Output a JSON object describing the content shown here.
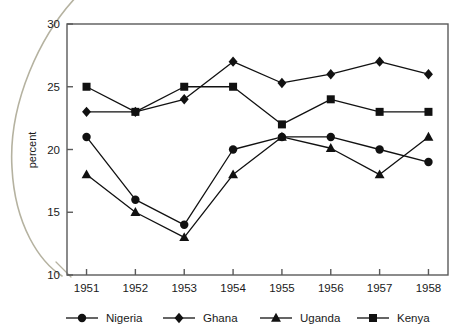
{
  "chart_data": {
    "type": "line",
    "title": "",
    "subtitle": "",
    "xlabel": "",
    "ylabel": "percent",
    "categories": [
      "1951",
      "1952",
      "1953",
      "1954",
      "1955",
      "1956",
      "1957",
      "1958"
    ],
    "x": [
      1951,
      1952,
      1953,
      1954,
      1955,
      1956,
      1957,
      1958
    ],
    "xlim": [
      1950.6,
      1958.4
    ],
    "ylim": [
      10,
      30
    ],
    "yticks": [
      10,
      15,
      20,
      25,
      30
    ],
    "ytick_labels": [
      "10",
      "15",
      "20",
      "25",
      "30"
    ],
    "xticks": [
      1951,
      1952,
      1953,
      1954,
      1955,
      1956,
      1957,
      1958
    ],
    "grid": false,
    "legend_position": "bottom",
    "series": [
      {
        "name": "Nigeria",
        "marker": "circle",
        "color": "#111111",
        "values": [
          21,
          16,
          14,
          20,
          21,
          21,
          20,
          19
        ]
      },
      {
        "name": "Ghana",
        "marker": "diamond",
        "color": "#111111",
        "values": [
          23,
          23,
          24,
          27,
          25.3,
          26,
          27,
          26
        ]
      },
      {
        "name": "Uganda",
        "marker": "triangle",
        "color": "#111111",
        "values": [
          18,
          15,
          13,
          18,
          21,
          20.1,
          18,
          21
        ]
      },
      {
        "name": "Kenya",
        "marker": "square",
        "color": "#111111",
        "values": [
          25,
          23,
          25,
          25,
          22,
          24,
          23,
          23
        ]
      }
    ]
  },
  "colors": {
    "ink": "#1a1a1a",
    "frame": "#5a5a5a",
    "series": "#111111",
    "scan_artifact": "#b5b2a0",
    "background": "#ffffff"
  },
  "legend": {
    "items": [
      {
        "label": "Nigeria",
        "marker": "circle"
      },
      {
        "label": "Ghana",
        "marker": "diamond"
      },
      {
        "label": "Uganda",
        "marker": "triangle"
      },
      {
        "label": "Kenya",
        "marker": "square"
      }
    ]
  },
  "axes": {
    "y_axis_label": "percent",
    "y_tick_labels": [
      "30",
      "25",
      "20",
      "15",
      "10"
    ],
    "x_tick_labels": [
      "1951",
      "1952",
      "1953",
      "1954",
      "1955",
      "1956",
      "1957",
      "1958"
    ]
  }
}
